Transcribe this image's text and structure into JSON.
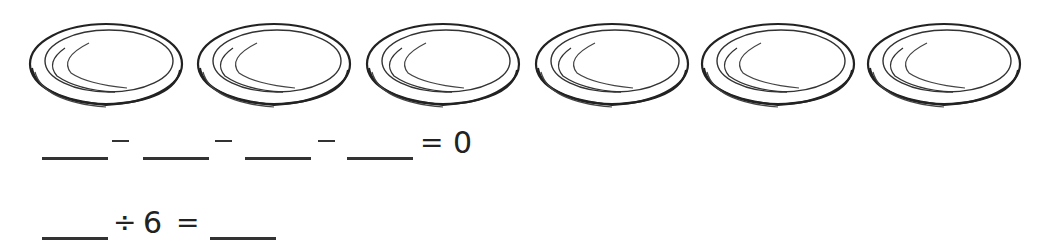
{
  "plates": {
    "count": 6,
    "icon": "plate-icon",
    "stroke_color": "#222222"
  },
  "equation1": {
    "blanks": [
      "",
      "",
      "",
      ""
    ],
    "operators": [
      "−",
      "−",
      "−"
    ],
    "equals": "=",
    "result": "0"
  },
  "equation2": {
    "blank_left": "",
    "operator": "÷",
    "divisor": "6",
    "equals": "=",
    "blank_right": ""
  }
}
